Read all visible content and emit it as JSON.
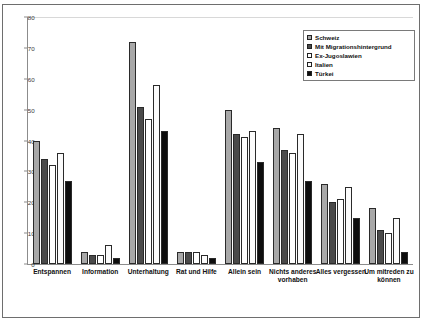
{
  "chart_data": {
    "type": "bar",
    "title": "",
    "xlabel": "",
    "ylabel": "",
    "ylim": [
      0,
      80
    ],
    "yticks": [
      0,
      10,
      20,
      30,
      40,
      50,
      60,
      70,
      80
    ],
    "ytick_labels": [
      "0",
      "10",
      "20",
      "30",
      "40",
      "50",
      "60",
      "70",
      "80"
    ],
    "grid": false,
    "legend_position": "top-right",
    "categories": [
      "Entspannen",
      "Information",
      "Unterhaltung",
      "Rat und Hilfe",
      "Allein sein",
      "Nichts anderes vorhaben",
      "Alles vergessen",
      "Um mitreden zu können"
    ],
    "series": [
      {
        "name": "Schweiz",
        "color": "#a8a8a8",
        "values": [
          40,
          4,
          72,
          4,
          50,
          44,
          26,
          18
        ]
      },
      {
        "name": "Mit Migrationshintergrund",
        "color": "#4a4a4a",
        "values": [
          34,
          3,
          51,
          4,
          42,
          37,
          20,
          11
        ]
      },
      {
        "name": "Ex-Jugoslawien",
        "color": "#ffffff",
        "values": [
          32,
          3,
          47,
          4,
          41,
          36,
          21,
          10
        ]
      },
      {
        "name": "Italien",
        "color": "#fbfbfb",
        "values": [
          36,
          6,
          58,
          3,
          43,
          42,
          25,
          15
        ]
      },
      {
        "name": "Türkei",
        "color": "#0d0d0d",
        "values": [
          27,
          2,
          43,
          2,
          33,
          27,
          15,
          4
        ]
      }
    ]
  }
}
